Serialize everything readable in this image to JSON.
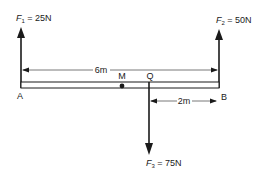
{
  "diagram": {
    "type": "beam-force-diagram",
    "colors": {
      "ink": "#1a1a1a",
      "background": "#ffffff"
    },
    "points": {
      "A": "A",
      "B": "B",
      "M": "M",
      "Q": "Q"
    },
    "forces": [
      {
        "id": "F1",
        "symbol": "F",
        "subscript": "1",
        "eq": " = 25N",
        "direction": "up",
        "at": "A"
      },
      {
        "id": "F2",
        "symbol": "F",
        "subscript": "2",
        "eq": " = 50N",
        "direction": "up",
        "at": "B"
      },
      {
        "id": "F3",
        "symbol": "F",
        "subscript": "3",
        "eq": " = 75N",
        "direction": "down",
        "at": "Q"
      }
    ],
    "dimensions": [
      {
        "id": "AB",
        "label": "6m",
        "from": "A",
        "to": "B"
      },
      {
        "id": "QB",
        "label": "2m",
        "from": "Q",
        "to": "B"
      }
    ]
  }
}
